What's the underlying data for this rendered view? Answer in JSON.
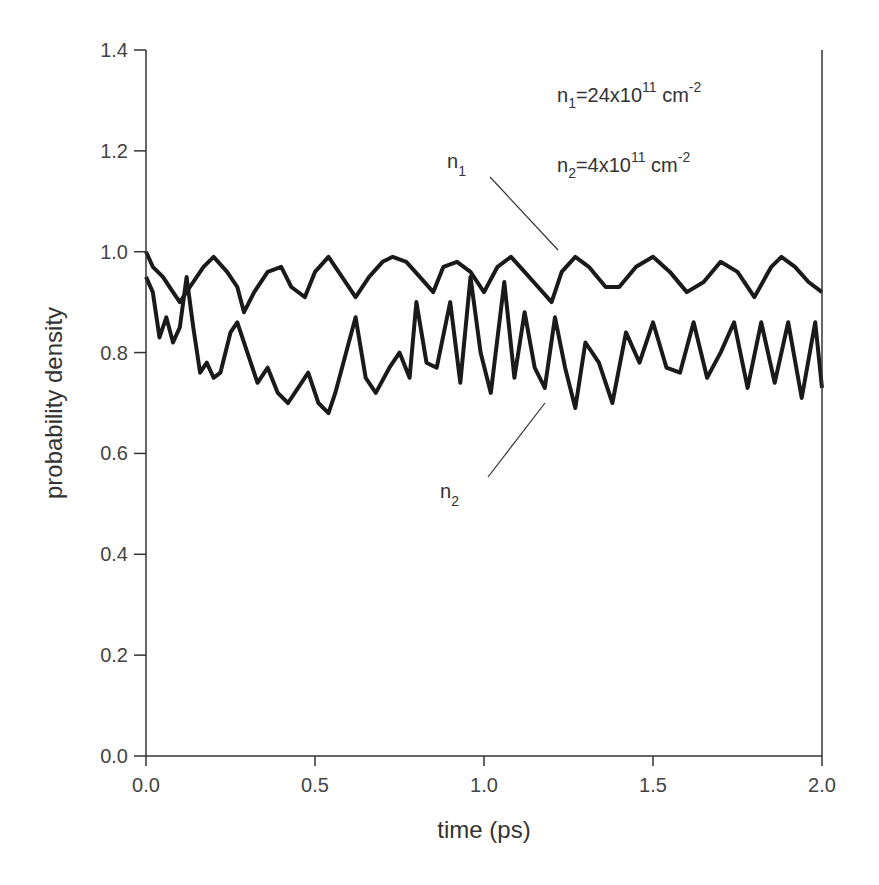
{
  "chart_data": {
    "type": "line",
    "title": "",
    "xlabel": "time (ps)",
    "ylabel": "probability density",
    "xlim": [
      0.0,
      2.0
    ],
    "ylim": [
      0.0,
      1.4
    ],
    "xticks": [
      "0.0",
      "0.5",
      "1.0",
      "1.5",
      "2.0"
    ],
    "yticks": [
      "0.0",
      "0.2",
      "0.4",
      "0.6",
      "0.8",
      "1.0",
      "1.2",
      "1.4"
    ],
    "grid": false,
    "annotations": {
      "n1_density": "n1=24x10^11 cm^-2",
      "n2_density": "n2=4x10^11 cm^-2",
      "n1_label": "n1",
      "n2_label": "n2"
    },
    "series": [
      {
        "name": "n1",
        "x": [
          0.0,
          0.02,
          0.05,
          0.08,
          0.1,
          0.13,
          0.17,
          0.2,
          0.24,
          0.27,
          0.29,
          0.32,
          0.36,
          0.4,
          0.43,
          0.47,
          0.5,
          0.54,
          0.58,
          0.62,
          0.66,
          0.7,
          0.73,
          0.77,
          0.81,
          0.85,
          0.88,
          0.92,
          0.96,
          1.0,
          1.04,
          1.08,
          1.12,
          1.16,
          1.2,
          1.23,
          1.27,
          1.31,
          1.36,
          1.4,
          1.45,
          1.5,
          1.55,
          1.6,
          1.65,
          1.7,
          1.75,
          1.8,
          1.85,
          1.88,
          1.92,
          1.96,
          2.0
        ],
        "y": [
          1.0,
          0.97,
          0.95,
          0.92,
          0.9,
          0.93,
          0.97,
          0.99,
          0.96,
          0.93,
          0.88,
          0.92,
          0.96,
          0.97,
          0.93,
          0.91,
          0.96,
          0.99,
          0.95,
          0.91,
          0.95,
          0.98,
          0.99,
          0.98,
          0.95,
          0.92,
          0.97,
          0.98,
          0.96,
          0.92,
          0.97,
          0.99,
          0.96,
          0.93,
          0.9,
          0.96,
          0.99,
          0.97,
          0.93,
          0.93,
          0.97,
          0.99,
          0.96,
          0.92,
          0.94,
          0.98,
          0.96,
          0.91,
          0.97,
          0.99,
          0.97,
          0.94,
          0.92
        ]
      },
      {
        "name": "n2",
        "x": [
          0.0,
          0.02,
          0.04,
          0.06,
          0.08,
          0.1,
          0.12,
          0.14,
          0.16,
          0.18,
          0.2,
          0.22,
          0.25,
          0.27,
          0.3,
          0.33,
          0.36,
          0.39,
          0.42,
          0.45,
          0.48,
          0.51,
          0.54,
          0.56,
          0.6,
          0.62,
          0.65,
          0.68,
          0.72,
          0.75,
          0.78,
          0.8,
          0.83,
          0.86,
          0.9,
          0.93,
          0.96,
          0.99,
          1.02,
          1.06,
          1.09,
          1.12,
          1.15,
          1.18,
          1.21,
          1.24,
          1.27,
          1.3,
          1.34,
          1.38,
          1.42,
          1.46,
          1.5,
          1.54,
          1.58,
          1.62,
          1.66,
          1.7,
          1.74,
          1.78,
          1.82,
          1.86,
          1.9,
          1.94,
          1.98,
          2.0
        ],
        "y": [
          0.95,
          0.92,
          0.83,
          0.87,
          0.82,
          0.85,
          0.95,
          0.85,
          0.76,
          0.78,
          0.75,
          0.76,
          0.84,
          0.86,
          0.8,
          0.74,
          0.77,
          0.72,
          0.7,
          0.73,
          0.76,
          0.7,
          0.68,
          0.72,
          0.82,
          0.87,
          0.75,
          0.72,
          0.77,
          0.8,
          0.75,
          0.9,
          0.78,
          0.77,
          0.9,
          0.74,
          0.95,
          0.8,
          0.72,
          0.94,
          0.75,
          0.88,
          0.77,
          0.73,
          0.87,
          0.77,
          0.69,
          0.82,
          0.78,
          0.7,
          0.84,
          0.78,
          0.86,
          0.77,
          0.76,
          0.86,
          0.75,
          0.8,
          0.86,
          0.73,
          0.86,
          0.74,
          0.86,
          0.71,
          0.86,
          0.73
        ]
      }
    ]
  }
}
